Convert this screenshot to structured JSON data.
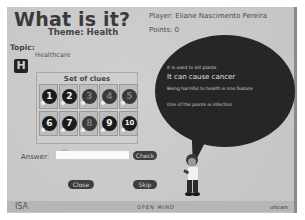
{
  "header": {
    "title": "What is it?",
    "theme": "Theme: Health",
    "player": "Player: Eliane Nascimento Pereira",
    "points": "Points: 0"
  },
  "topic": {
    "label": "Topic:",
    "value": "Healthcare",
    "letter": "H"
  },
  "clues": {
    "title": "Set of clues",
    "items": [
      {
        "n": "1",
        "state": "active"
      },
      {
        "n": "2",
        "state": "active"
      },
      {
        "n": "3",
        "state": "dim"
      },
      {
        "n": "4",
        "state": "dim"
      },
      {
        "n": "5",
        "state": "dim"
      },
      {
        "n": "6",
        "state": "active"
      },
      {
        "n": "7",
        "state": "active"
      },
      {
        "n": "8",
        "state": "dim"
      },
      {
        "n": "9",
        "state": "active"
      },
      {
        "n": "10",
        "state": "active"
      }
    ]
  },
  "bubble": {
    "lines": [
      "It is used to kill plants",
      "It can cause cancer",
      "Being harmful to health is one feature",
      "One of the points is infection"
    ]
  },
  "answer": {
    "label": "Answer:",
    "value": "",
    "check_label": "Check"
  },
  "buttons": {
    "close_label": "Close",
    "skip_label": "Skip"
  },
  "footer": {
    "left": "ISA",
    "center": "OPEN MIND",
    "right": "ufscam"
  }
}
